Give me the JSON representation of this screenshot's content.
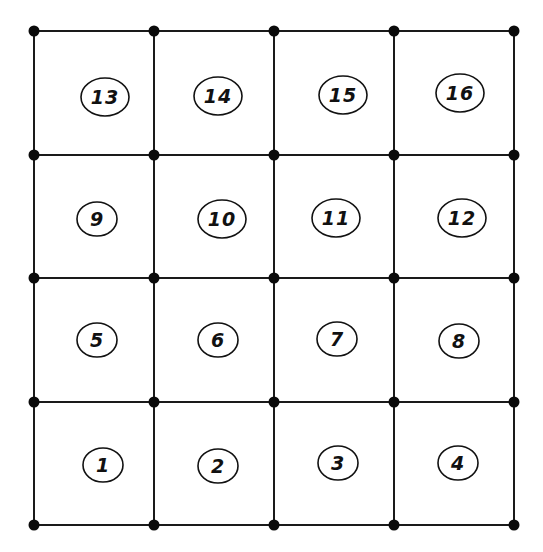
{
  "diagram": {
    "type": "finite-element-mesh",
    "grid": {
      "columns_x": [
        34,
        154,
        274,
        394,
        514
      ],
      "rows_y": [
        31,
        155,
        278,
        402,
        525
      ]
    },
    "colors": {
      "line": "#1a1a1a",
      "node": "#0a0a0a",
      "background": "#ffffff"
    },
    "elements": [
      {
        "label": "13",
        "cx": 105,
        "cy": 97
      },
      {
        "label": "14",
        "cx": 218,
        "cy": 96
      },
      {
        "label": "15",
        "cx": 343,
        "cy": 95
      },
      {
        "label": "16",
        "cx": 460,
        "cy": 93
      },
      {
        "label": "9",
        "cx": 97,
        "cy": 219
      },
      {
        "label": "10",
        "cx": 222,
        "cy": 219
      },
      {
        "label": "11",
        "cx": 336,
        "cy": 218
      },
      {
        "label": "12",
        "cx": 462,
        "cy": 218
      },
      {
        "label": "5",
        "cx": 97,
        "cy": 340
      },
      {
        "label": "6",
        "cx": 218,
        "cy": 340
      },
      {
        "label": "7",
        "cx": 337,
        "cy": 339
      },
      {
        "label": "8",
        "cx": 459,
        "cy": 341
      },
      {
        "label": "1",
        "cx": 103,
        "cy": 465
      },
      {
        "label": "2",
        "cx": 218,
        "cy": 466
      },
      {
        "label": "3",
        "cx": 338,
        "cy": 463
      },
      {
        "label": "4",
        "cx": 458,
        "cy": 463
      }
    ]
  }
}
